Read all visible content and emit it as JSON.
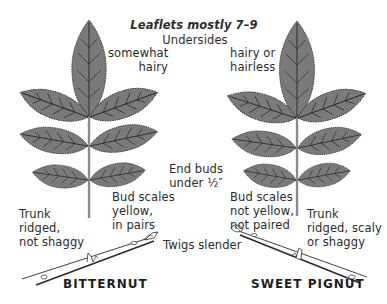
{
  "title": "Leaflets mostly 7–9",
  "undersides_heading": "Undersides",
  "species": [
    {
      "name": "BITTERNUT",
      "underside_note": [
        "somewhat",
        "hairy"
      ],
      "bud_note": [
        "Bud scales",
        "yellow,",
        "in pairs"
      ],
      "trunk_note": [
        "Trunk",
        "ridged,",
        "not shaggy"
      ]
    },
    {
      "name": "SWEET PIGNUT",
      "underside_note": [
        "hairy or",
        "hairless"
      ],
      "bud_note": [
        "Bud scales",
        "not yellow,",
        "not paired"
      ],
      "trunk_note": [
        "Trunk",
        "ridged, scaly",
        "or shaggy"
      ]
    }
  ],
  "shared_notes": {
    "end_buds": [
      "End buds",
      "under ½″"
    ],
    "twigs": "Twigs slender"
  },
  "colors": {
    "leaf_fill": "#7a7a7a",
    "leaf_vein": "#2e2e2e",
    "leaf_outline": "#3a3a3a",
    "stem": "#9a9a9a",
    "text": "#2b2b2b"
  },
  "icons": {
    "left_leaf": "compound-leaf-icon",
    "right_leaf": "compound-leaf-icon",
    "left_twig": "twig-icon",
    "right_twig": "twig-icon"
  }
}
